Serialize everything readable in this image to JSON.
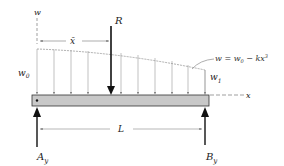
{
  "figure": {
    "labels": {
      "w_axis": "w",
      "x_bar": "x̄",
      "resultant": "R",
      "w0": "w",
      "w0_sub": "0",
      "w1": "w",
      "w1_sub": "1",
      "x_axis": "x",
      "length": "L",
      "Ay": "A",
      "Ay_sub": "y",
      "By": "B",
      "By_sub": "y"
    },
    "equation": {
      "lhs": "w = w",
      "sub": "0",
      "rhs": " − kx",
      "sup": "3"
    },
    "colors": {
      "beam_fill": "#c8c8c8",
      "beam_stroke": "#333333",
      "load_line": "#999999",
      "arrow": "#111111"
    }
  }
}
